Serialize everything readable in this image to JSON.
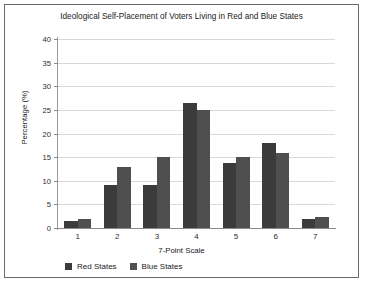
{
  "chart_data": {
    "type": "bar",
    "title": "Ideological Self-Placement of Voters Living in Red and Blue States",
    "xlabel": "7-Point Scale",
    "ylabel": "Percentage (%)",
    "categories": [
      "1",
      "2",
      "3",
      "4",
      "5",
      "6",
      "7"
    ],
    "series": [
      {
        "name": "Red States",
        "color": "#3b3b3b",
        "values": [
          1.5,
          9,
          9.2,
          26.5,
          13.7,
          18,
          2
        ]
      },
      {
        "name": "Blue States",
        "color": "#4f4f4f",
        "values": [
          2,
          13,
          15,
          25,
          15,
          15.8,
          2.4
        ]
      }
    ],
    "ylim": [
      0,
      40
    ],
    "yticks": [
      0,
      5,
      10,
      15,
      20,
      25,
      30,
      35,
      40
    ],
    "ytick_labels": [
      "0",
      "5",
      "10",
      "15",
      "20",
      "25",
      "30",
      "35",
      "40"
    ],
    "grid": true,
    "legend_position": "bottom-left"
  }
}
